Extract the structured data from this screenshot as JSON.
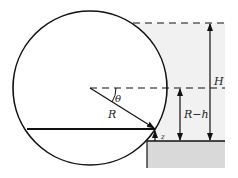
{
  "diagram": {
    "type": "cylinder-in-fluid-geometry",
    "labels": {
      "theta": "θ",
      "radius": "R",
      "height_total": "H",
      "height_r_minus_h": "R−h",
      "z": "z"
    },
    "colors": {
      "line": "#111111",
      "fluid": "#f1f1f1",
      "ground": "#d9d9d9",
      "background": "#ffffff"
    }
  }
}
